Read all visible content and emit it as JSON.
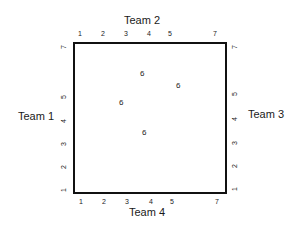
{
  "teams": {
    "top": "Team 2",
    "left": "Team 1",
    "right": "Team 3",
    "bottom": "Team 4"
  },
  "ticks": {
    "top": [
      "1",
      "2",
      "3",
      "4",
      "5",
      "7"
    ],
    "bottom": [
      "1",
      "2",
      "3",
      "4",
      "5",
      "7"
    ],
    "left": [
      "7",
      "5",
      "4",
      "3",
      "2",
      "1"
    ],
    "right": [
      "7",
      "5",
      "4",
      "3",
      "2",
      "1"
    ]
  },
  "inner_labels": [
    "6",
    "6",
    "6",
    "6"
  ],
  "colors": {
    "line": "#111111",
    "text": "#1a1a1a",
    "background": "#ffffff"
  }
}
